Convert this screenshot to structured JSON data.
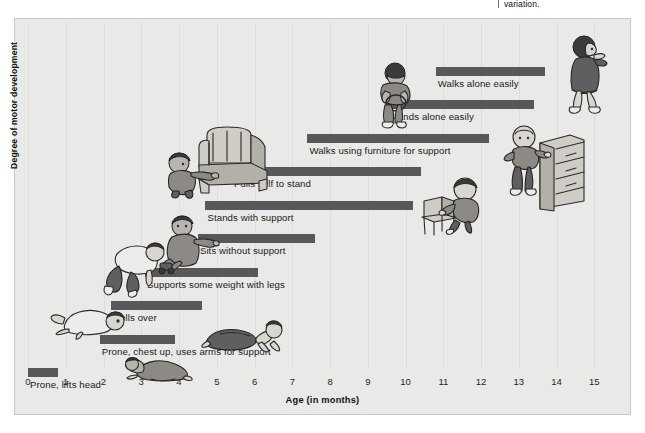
{
  "caption_fragment": "variation.",
  "chart_data": {
    "type": "bar",
    "orientation": "horizontal",
    "title": "",
    "xlabel": "Age (in months)",
    "ylabel": "Degree of motor development",
    "xlim": [
      0,
      15.6
    ],
    "xticks": [
      "0",
      "1",
      "2",
      "3",
      "4",
      "5",
      "6",
      "7",
      "8",
      "9",
      "10",
      "11",
      "12",
      "13",
      "14",
      "15"
    ],
    "grid": "vertical",
    "legend": "none",
    "bar_color": "#58585a",
    "background_color": "#e9e9e7",
    "categories": [
      "Prone, lifts head",
      "Prone, chest up, uses arms for support",
      "Rolls over",
      "Supports some weight with legs",
      "Sits without support",
      "Stands with support",
      "Pulls self to stand",
      "Walks using furniture for support",
      "Stands alone easily",
      "Walks alone easily"
    ],
    "ranges": [
      {
        "label": "Prone, lifts head",
        "start": 0.0,
        "end": 0.8
      },
      {
        "label": "Prone, chest up, uses arms for support",
        "start": 1.9,
        "end": 3.9
      },
      {
        "label": "Rolls over",
        "start": 2.2,
        "end": 4.6
      },
      {
        "label": "Supports some weight with legs",
        "start": 3.1,
        "end": 6.1
      },
      {
        "label": "Sits without support",
        "start": 4.5,
        "end": 7.6
      },
      {
        "label": "Stands with support",
        "start": 4.7,
        "end": 10.2
      },
      {
        "label": "Pulls self to stand",
        "start": 5.4,
        "end": 10.4
      },
      {
        "label": "Walks using furniture for support",
        "start": 7.4,
        "end": 12.2
      },
      {
        "label": "Stands alone easily",
        "start": 9.5,
        "end": 13.4
      },
      {
        "label": "Walks alone easily",
        "start": 10.8,
        "end": 13.7
      }
    ]
  },
  "figures": [
    {
      "name": "infant-prone-lifts-head"
    },
    {
      "name": "infant-prone-chest-up"
    },
    {
      "name": "infant-rolls-over"
    },
    {
      "name": "infant-supports-weight"
    },
    {
      "name": "infant-sits-with-toy"
    },
    {
      "name": "infant-stands-holding-armchair"
    },
    {
      "name": "armchair"
    },
    {
      "name": "toddler-standing-alone"
    },
    {
      "name": "toddler-pushing-chair"
    },
    {
      "name": "chair"
    },
    {
      "name": "toddler-cruising-dresser"
    },
    {
      "name": "dresser"
    },
    {
      "name": "child-walking"
    }
  ]
}
